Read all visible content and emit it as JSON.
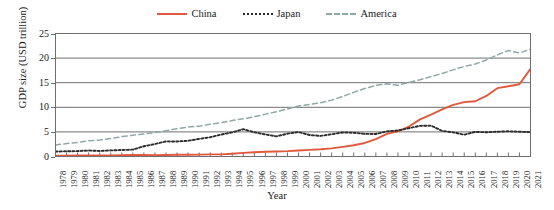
{
  "chart_data": {
    "type": "line",
    "title": "",
    "xlabel": "Year",
    "ylabel": "GDP size (USD trillion)",
    "ylim": [
      0,
      25
    ],
    "yticks": [
      0,
      5,
      10,
      15,
      20,
      25
    ],
    "grid": "horizontal",
    "legend_position": "top-center",
    "categories": [
      "1978",
      "1979",
      "1980",
      "1981",
      "1982",
      "1983",
      "1984",
      "1985",
      "1986",
      "1987",
      "1988",
      "1989",
      "1990",
      "1991",
      "1992",
      "1993",
      "1994",
      "1995",
      "1996",
      "1997",
      "1998",
      "1999",
      "2000",
      "2001",
      "2002",
      "2003",
      "2004",
      "2005",
      "2006",
      "2007",
      "2008",
      "2009",
      "2010",
      "2011",
      "2012",
      "2013",
      "2014",
      "2015",
      "2016",
      "2017",
      "2018",
      "2019",
      "2020",
      "2021"
    ],
    "series": [
      {
        "name": "China",
        "color": "#E1593C",
        "style": "solid",
        "values": [
          0.15,
          0.18,
          0.19,
          0.2,
          0.2,
          0.23,
          0.26,
          0.31,
          0.3,
          0.27,
          0.31,
          0.35,
          0.36,
          0.38,
          0.43,
          0.44,
          0.56,
          0.73,
          0.86,
          0.96,
          1.03,
          1.09,
          1.21,
          1.34,
          1.47,
          1.66,
          1.96,
          2.29,
          2.75,
          3.55,
          4.59,
          5.1,
          6.09,
          7.55,
          8.53,
          9.57,
          10.48,
          11.06,
          11.23,
          12.31,
          13.89,
          14.28,
          14.69,
          17.82
        ]
      },
      {
        "name": "Japan",
        "color": "#2B2B2B",
        "style": "dotted",
        "values": [
          1.01,
          1.06,
          1.1,
          1.22,
          1.13,
          1.24,
          1.32,
          1.4,
          2.08,
          2.53,
          3.07,
          3.05,
          3.19,
          3.58,
          3.91,
          4.46,
          4.91,
          5.55,
          4.92,
          4.49,
          4.1,
          4.64,
          4.97,
          4.37,
          4.18,
          4.52,
          4.89,
          4.83,
          4.6,
          4.58,
          5.11,
          5.29,
          5.76,
          6.23,
          6.27,
          5.21,
          4.9,
          4.44,
          5.0,
          4.93,
          5.04,
          5.12,
          5.04,
          4.94
        ]
      },
      {
        "name": "America",
        "color": "#8FA8A5",
        "style": "dashed",
        "values": [
          2.35,
          2.63,
          2.86,
          3.21,
          3.35,
          3.64,
          4.04,
          4.34,
          4.58,
          4.86,
          5.25,
          5.66,
          5.98,
          6.17,
          6.54,
          6.88,
          7.31,
          7.66,
          8.1,
          8.61,
          9.09,
          9.66,
          10.25,
          10.58,
          10.94,
          11.46,
          12.21,
          13.04,
          13.82,
          14.45,
          14.77,
          14.48,
          15.05,
          15.6,
          16.25,
          16.88,
          17.61,
          18.3,
          18.8,
          19.61,
          20.66,
          21.54,
          21.06,
          21.8
        ]
      }
    ]
  },
  "legend": {
    "entries": [
      {
        "label": "China"
      },
      {
        "label": "Japan"
      },
      {
        "label": "America"
      }
    ]
  }
}
